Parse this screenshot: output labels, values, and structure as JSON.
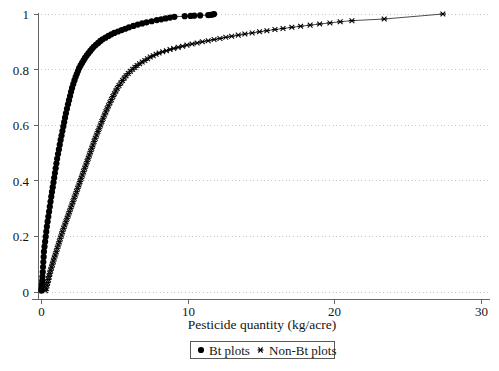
{
  "figure": {
    "background_color": "#ffffff",
    "foreground_color": "#000000",
    "width": 499,
    "height": 371
  },
  "axes": {
    "x_title": "Pesticide quantity (kg/acre)",
    "y_title": "",
    "x_ticks": [
      "0",
      "10",
      "20",
      "30"
    ],
    "y_ticks": [
      "0",
      "0.2",
      "0.4",
      "0.6",
      "0.8",
      "1"
    ],
    "grid": "horizontal-dotted",
    "grid_color": "#b9b9b9",
    "axis_color": "#666666"
  },
  "legend": {
    "position": "below-axis-centered",
    "border_color": "#585858",
    "entries": [
      {
        "label": "Bt plots",
        "marker": "filled-circle",
        "color": "#000000"
      },
      {
        "label": "Non-Bt plots",
        "marker": "cross-x",
        "color": "#000000"
      }
    ]
  },
  "chart_data": {
    "type": "line",
    "title": "",
    "subtitle": "",
    "xlabel": "Pesticide quantity (kg/acre)",
    "ylabel": "",
    "xlim": [
      0,
      30
    ],
    "ylim": [
      0,
      1
    ],
    "xticks": [
      0,
      10,
      20,
      30
    ],
    "yticks": [
      0,
      0.2,
      0.4,
      0.6,
      0.8,
      1
    ],
    "grid": true,
    "grid_axis": "y",
    "legend_position": "bottom",
    "annotations": [],
    "series": [
      {
        "name": "Bt plots",
        "marker": "filled-circle",
        "marker_size": 3.1,
        "color": "#000000",
        "points": [
          [
            0.02,
            0.005
          ],
          [
            0.04,
            0.015
          ],
          [
            0.06,
            0.027
          ],
          [
            0.08,
            0.04
          ],
          [
            0.1,
            0.055
          ],
          [
            0.12,
            0.072
          ],
          [
            0.14,
            0.09
          ],
          [
            0.16,
            0.108
          ],
          [
            0.18,
            0.126
          ],
          [
            0.2,
            0.145
          ],
          [
            0.24,
            0.163
          ],
          [
            0.28,
            0.181
          ],
          [
            0.32,
            0.199
          ],
          [
            0.36,
            0.217
          ],
          [
            0.4,
            0.235
          ],
          [
            0.45,
            0.253
          ],
          [
            0.5,
            0.271
          ],
          [
            0.55,
            0.289
          ],
          [
            0.6,
            0.307
          ],
          [
            0.65,
            0.325
          ],
          [
            0.7,
            0.343
          ],
          [
            0.75,
            0.36
          ],
          [
            0.8,
            0.377
          ],
          [
            0.85,
            0.394
          ],
          [
            0.9,
            0.411
          ],
          [
            0.95,
            0.428
          ],
          [
            1.0,
            0.445
          ],
          [
            1.05,
            0.462
          ],
          [
            1.1,
            0.479
          ],
          [
            1.16,
            0.496
          ],
          [
            1.22,
            0.513
          ],
          [
            1.28,
            0.53
          ],
          [
            1.34,
            0.547
          ],
          [
            1.4,
            0.563
          ],
          [
            1.46,
            0.579
          ],
          [
            1.52,
            0.595
          ],
          [
            1.58,
            0.611
          ],
          [
            1.64,
            0.627
          ],
          [
            1.7,
            0.643
          ],
          [
            1.77,
            0.659
          ],
          [
            1.84,
            0.675
          ],
          [
            1.91,
            0.69
          ],
          [
            1.98,
            0.705
          ],
          [
            2.05,
            0.72
          ],
          [
            2.12,
            0.734
          ],
          [
            2.2,
            0.748
          ],
          [
            2.28,
            0.761
          ],
          [
            2.36,
            0.773
          ],
          [
            2.44,
            0.784
          ],
          [
            2.52,
            0.795
          ],
          [
            2.6,
            0.805
          ],
          [
            2.7,
            0.815
          ],
          [
            2.8,
            0.824
          ],
          [
            2.9,
            0.833
          ],
          [
            3.0,
            0.842
          ],
          [
            3.12,
            0.851
          ],
          [
            3.24,
            0.859
          ],
          [
            3.36,
            0.867
          ],
          [
            3.48,
            0.875
          ],
          [
            3.6,
            0.882
          ],
          [
            3.75,
            0.889
          ],
          [
            3.9,
            0.896
          ],
          [
            4.05,
            0.903
          ],
          [
            4.2,
            0.909
          ],
          [
            4.4,
            0.915
          ],
          [
            4.6,
            0.921
          ],
          [
            4.8,
            0.927
          ],
          [
            5.0,
            0.932
          ],
          [
            5.25,
            0.937
          ],
          [
            5.5,
            0.942
          ],
          [
            5.75,
            0.947
          ],
          [
            6.0,
            0.952
          ],
          [
            6.3,
            0.957
          ],
          [
            6.6,
            0.962
          ],
          [
            6.9,
            0.966
          ],
          [
            7.2,
            0.97
          ],
          [
            7.55,
            0.974
          ],
          [
            7.9,
            0.978
          ],
          [
            8.2,
            0.981
          ],
          [
            8.5,
            0.984
          ],
          [
            8.8,
            0.987
          ],
          [
            9.1,
            0.99
          ],
          [
            9.8,
            0.992
          ],
          [
            10.2,
            0.993
          ],
          [
            10.45,
            0.994
          ],
          [
            10.85,
            0.995
          ],
          [
            11.4,
            0.996
          ],
          [
            11.55,
            0.997
          ],
          [
            11.7,
            0.998
          ],
          [
            11.8,
            1.0
          ]
        ]
      },
      {
        "name": "Non-Bt plots",
        "marker": "cross-x",
        "marker_size": 3.0,
        "color": "#000000",
        "points": [
          [
            0.3,
            0.005
          ],
          [
            0.35,
            0.014
          ],
          [
            0.4,
            0.024
          ],
          [
            0.45,
            0.034
          ],
          [
            0.5,
            0.045
          ],
          [
            0.55,
            0.056
          ],
          [
            0.6,
            0.067
          ],
          [
            0.66,
            0.078
          ],
          [
            0.72,
            0.089
          ],
          [
            0.78,
            0.1
          ],
          [
            0.84,
            0.111
          ],
          [
            0.9,
            0.122
          ],
          [
            0.97,
            0.133
          ],
          [
            1.04,
            0.145
          ],
          [
            1.11,
            0.157
          ],
          [
            1.18,
            0.169
          ],
          [
            1.25,
            0.181
          ],
          [
            1.32,
            0.193
          ],
          [
            1.39,
            0.205
          ],
          [
            1.46,
            0.217
          ],
          [
            1.54,
            0.229
          ],
          [
            1.62,
            0.241
          ],
          [
            1.7,
            0.253
          ],
          [
            1.78,
            0.265
          ],
          [
            1.86,
            0.277
          ],
          [
            1.94,
            0.289
          ],
          [
            2.02,
            0.301
          ],
          [
            2.1,
            0.313
          ],
          [
            2.18,
            0.325
          ],
          [
            2.26,
            0.337
          ],
          [
            2.34,
            0.349
          ],
          [
            2.42,
            0.361
          ],
          [
            2.5,
            0.373
          ],
          [
            2.58,
            0.385
          ],
          [
            2.66,
            0.397
          ],
          [
            2.74,
            0.409
          ],
          [
            2.82,
            0.421
          ],
          [
            2.9,
            0.433
          ],
          [
            2.98,
            0.445
          ],
          [
            3.06,
            0.457
          ],
          [
            3.14,
            0.469
          ],
          [
            3.22,
            0.481
          ],
          [
            3.3,
            0.493
          ],
          [
            3.38,
            0.505
          ],
          [
            3.46,
            0.517
          ],
          [
            3.54,
            0.529
          ],
          [
            3.62,
            0.541
          ],
          [
            3.7,
            0.553
          ],
          [
            3.79,
            0.565
          ],
          [
            3.88,
            0.577
          ],
          [
            3.97,
            0.589
          ],
          [
            4.06,
            0.601
          ],
          [
            4.15,
            0.613
          ],
          [
            4.24,
            0.625
          ],
          [
            4.33,
            0.637
          ],
          [
            4.42,
            0.648
          ],
          [
            4.51,
            0.659
          ],
          [
            4.6,
            0.67
          ],
          [
            4.7,
            0.681
          ],
          [
            4.8,
            0.692
          ],
          [
            4.9,
            0.703
          ],
          [
            5.0,
            0.713
          ],
          [
            5.1,
            0.723
          ],
          [
            5.2,
            0.733
          ],
          [
            5.32,
            0.743
          ],
          [
            5.44,
            0.752
          ],
          [
            5.56,
            0.761
          ],
          [
            5.68,
            0.77
          ],
          [
            5.8,
            0.778
          ],
          [
            5.95,
            0.786
          ],
          [
            6.1,
            0.794
          ],
          [
            6.25,
            0.801
          ],
          [
            6.4,
            0.808
          ],
          [
            6.55,
            0.815
          ],
          [
            6.72,
            0.821
          ],
          [
            6.9,
            0.827
          ],
          [
            7.08,
            0.833
          ],
          [
            7.26,
            0.839
          ],
          [
            7.45,
            0.845
          ],
          [
            7.65,
            0.85
          ],
          [
            7.85,
            0.855
          ],
          [
            8.05,
            0.86
          ],
          [
            8.3,
            0.864
          ],
          [
            8.55,
            0.868
          ],
          [
            8.8,
            0.872
          ],
          [
            9.05,
            0.876
          ],
          [
            9.35,
            0.88
          ],
          [
            9.65,
            0.884
          ],
          [
            9.95,
            0.888
          ],
          [
            10.3,
            0.892
          ],
          [
            10.65,
            0.896
          ],
          [
            11.0,
            0.9
          ],
          [
            11.4,
            0.904
          ],
          [
            11.8,
            0.908
          ],
          [
            12.2,
            0.912
          ],
          [
            12.6,
            0.916
          ],
          [
            13.0,
            0.92
          ],
          [
            13.45,
            0.924
          ],
          [
            13.9,
            0.928
          ],
          [
            14.4,
            0.932
          ],
          [
            14.9,
            0.936
          ],
          [
            15.4,
            0.94
          ],
          [
            15.95,
            0.944
          ],
          [
            16.5,
            0.948
          ],
          [
            17.1,
            0.952
          ],
          [
            17.7,
            0.956
          ],
          [
            18.35,
            0.96
          ],
          [
            19.0,
            0.964
          ],
          [
            19.7,
            0.968
          ],
          [
            20.4,
            0.972
          ],
          [
            21.2,
            0.976
          ],
          [
            23.4,
            0.982
          ],
          [
            27.4,
            1.0
          ]
        ]
      }
    ]
  },
  "plot_geometry": {
    "x0_px": 41,
    "x30_px": 481,
    "y0_px": 292,
    "y1_px": 14
  }
}
